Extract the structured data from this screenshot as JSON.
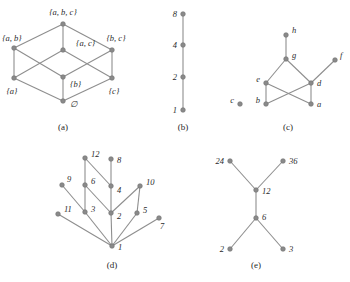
{
  "figure": {
    "width": 350,
    "height": 282,
    "background": "#ffffff",
    "node_color": "#8a8a8a",
    "edge_color": "#8e8e8e",
    "label_color": "#2b2b2b"
  },
  "panels": [
    {
      "id": "a",
      "caption": "(a)",
      "caption_pos": [
        63,
        130
      ],
      "description": "power-set-lattice",
      "nodes": [
        {
          "name": "abc",
          "label": "{a, b, c}",
          "x": 63,
          "y": 24,
          "label_x": 63,
          "label_y": 15,
          "anchor": "middle"
        },
        {
          "name": "ab",
          "label": "{a, b}",
          "x": 14,
          "y": 48,
          "label_x": 12,
          "label_y": 41,
          "anchor": "middle"
        },
        {
          "name": "ac",
          "label": "{a, c}",
          "x": 63,
          "y": 50,
          "label_x": 76,
          "label_y": 46,
          "anchor": "start"
        },
        {
          "name": "bc",
          "label": "{b, c}",
          "x": 112,
          "y": 50,
          "label_x": 116,
          "label_y": 41,
          "anchor": "middle"
        },
        {
          "name": "a",
          "label": "{a}",
          "x": 14,
          "y": 78,
          "label_x": 12,
          "label_y": 94,
          "anchor": "middle"
        },
        {
          "name": "b",
          "label": "{b}",
          "x": 63,
          "y": 77,
          "label_x": 70,
          "label_y": 87,
          "anchor": "start"
        },
        {
          "name": "c",
          "label": "{c}",
          "x": 112,
          "y": 78,
          "label_x": 114,
          "label_y": 94,
          "anchor": "middle"
        },
        {
          "name": "empty",
          "label": "∅",
          "x": 63,
          "y": 101,
          "label_x": 70,
          "label_y": 107,
          "anchor": "start"
        }
      ],
      "edges": [
        [
          "abc",
          "ab"
        ],
        [
          "abc",
          "ac"
        ],
        [
          "abc",
          "bc"
        ],
        [
          "ab",
          "a"
        ],
        [
          "ab",
          "b"
        ],
        [
          "ac",
          "a"
        ],
        [
          "ac",
          "c"
        ],
        [
          "bc",
          "b"
        ],
        [
          "bc",
          "c"
        ],
        [
          "a",
          "empty"
        ],
        [
          "b",
          "empty"
        ],
        [
          "c",
          "empty"
        ]
      ]
    },
    {
      "id": "b",
      "caption": "(b)",
      "caption_pos": [
        183,
        130
      ],
      "description": "divisibility-chain",
      "nodes": [
        {
          "name": "n8",
          "label": "8",
          "x": 183,
          "y": 14,
          "label_x": 177,
          "label_y": 17,
          "anchor": "end"
        },
        {
          "name": "n4",
          "label": "4",
          "x": 183,
          "y": 45,
          "label_x": 177,
          "label_y": 48,
          "anchor": "end"
        },
        {
          "name": "n2",
          "label": "2",
          "x": 183,
          "y": 77,
          "label_x": 177,
          "label_y": 80,
          "anchor": "end"
        },
        {
          "name": "n1",
          "label": "1",
          "x": 183,
          "y": 110,
          "label_x": 177,
          "label_y": 113,
          "anchor": "end"
        }
      ],
      "edges": [
        [
          "n8",
          "n4"
        ],
        [
          "n4",
          "n2"
        ],
        [
          "n2",
          "n1"
        ]
      ]
    },
    {
      "id": "c",
      "caption": "(c)",
      "caption_pos": [
        288,
        130
      ],
      "description": "poset-with-isolated-element",
      "nodes": [
        {
          "name": "h",
          "label": "h",
          "x": 286,
          "y": 35,
          "label_x": 292,
          "label_y": 33,
          "anchor": "start"
        },
        {
          "name": "g",
          "label": "g",
          "x": 286,
          "y": 59,
          "label_x": 292,
          "label_y": 58,
          "anchor": "start"
        },
        {
          "name": "f",
          "label": "f",
          "x": 335,
          "y": 60,
          "label_x": 340,
          "label_y": 58,
          "anchor": "start"
        },
        {
          "name": "e",
          "label": "e",
          "x": 266,
          "y": 83,
          "label_x": 260,
          "label_y": 82,
          "anchor": "end"
        },
        {
          "name": "d",
          "label": "d",
          "x": 311,
          "y": 83,
          "label_x": 317,
          "label_y": 86,
          "anchor": "start"
        },
        {
          "name": "c",
          "label": "c",
          "x": 240,
          "y": 104,
          "label_x": 234,
          "label_y": 103,
          "anchor": "end"
        },
        {
          "name": "b",
          "label": "b",
          "x": 266,
          "y": 104,
          "label_x": 260,
          "label_y": 103,
          "anchor": "end"
        },
        {
          "name": "a",
          "label": "a",
          "x": 311,
          "y": 104,
          "label_x": 317,
          "label_y": 107,
          "anchor": "start"
        }
      ],
      "edges": [
        [
          "h",
          "g"
        ],
        [
          "g",
          "e"
        ],
        [
          "g",
          "d"
        ],
        [
          "d",
          "f"
        ],
        [
          "e",
          "b"
        ],
        [
          "e",
          "a"
        ],
        [
          "d",
          "b"
        ],
        [
          "d",
          "a"
        ]
      ]
    },
    {
      "id": "d",
      "caption": "(d)",
      "caption_pos": [
        112,
        268
      ],
      "description": "divisibility-lattice-1-to-12",
      "nodes": [
        {
          "name": "n12",
          "label": "12",
          "x": 85,
          "y": 158,
          "label_x": 91,
          "label_y": 157,
          "anchor": "start"
        },
        {
          "name": "n8",
          "label": "8",
          "x": 111,
          "y": 159,
          "label_x": 117,
          "label_y": 163,
          "anchor": "start"
        },
        {
          "name": "n9",
          "label": "9",
          "x": 62,
          "y": 185,
          "label_x": 67,
          "label_y": 182,
          "anchor": "start"
        },
        {
          "name": "n6",
          "label": "6",
          "x": 85,
          "y": 185,
          "label_x": 91,
          "label_y": 184,
          "anchor": "start"
        },
        {
          "name": "n4",
          "label": "4",
          "x": 111,
          "y": 186,
          "label_x": 117,
          "label_y": 193,
          "anchor": "start"
        },
        {
          "name": "n10",
          "label": "10",
          "x": 140,
          "y": 186,
          "label_x": 146,
          "label_y": 185,
          "anchor": "start"
        },
        {
          "name": "n11",
          "label": "11",
          "x": 58,
          "y": 214,
          "label_x": 64,
          "label_y": 212,
          "anchor": "start"
        },
        {
          "name": "n3",
          "label": "3",
          "x": 85,
          "y": 212,
          "label_x": 91,
          "label_y": 212,
          "anchor": "start"
        },
        {
          "name": "n2",
          "label": "2",
          "x": 111,
          "y": 213,
          "label_x": 117,
          "label_y": 219,
          "anchor": "start"
        },
        {
          "name": "n5",
          "label": "5",
          "x": 137,
          "y": 213,
          "label_x": 143,
          "label_y": 213,
          "anchor": "start"
        },
        {
          "name": "n7",
          "label": "7",
          "x": 159,
          "y": 218,
          "label_x": 160,
          "label_y": 229,
          "anchor": "start"
        },
        {
          "name": "n1",
          "label": "1",
          "x": 112,
          "y": 246,
          "label_x": 118,
          "label_y": 250,
          "anchor": "start"
        }
      ],
      "edges": [
        [
          "n12",
          "n6"
        ],
        [
          "n12",
          "n4"
        ],
        [
          "n8",
          "n4"
        ],
        [
          "n9",
          "n3"
        ],
        [
          "n6",
          "n3"
        ],
        [
          "n6",
          "n2"
        ],
        [
          "n4",
          "n2"
        ],
        [
          "n10",
          "n5"
        ],
        [
          "n10",
          "n2"
        ],
        [
          "n11",
          "n1"
        ],
        [
          "n3",
          "n1"
        ],
        [
          "n2",
          "n1"
        ],
        [
          "n5",
          "n1"
        ],
        [
          "n7",
          "n1"
        ]
      ]
    },
    {
      "id": "e",
      "caption": "(e)",
      "caption_pos": [
        256,
        268
      ],
      "description": "divisor-poset",
      "nodes": [
        {
          "name": "n24",
          "label": "24",
          "x": 230,
          "y": 161,
          "label_x": 224,
          "label_y": 164,
          "anchor": "end"
        },
        {
          "name": "n36",
          "label": "36",
          "x": 283,
          "y": 161,
          "label_x": 289,
          "label_y": 164,
          "anchor": "start"
        },
        {
          "name": "n12",
          "label": "12",
          "x": 256,
          "y": 190,
          "label_x": 262,
          "label_y": 194,
          "anchor": "start"
        },
        {
          "name": "n6",
          "label": "6",
          "x": 256,
          "y": 218,
          "label_x": 262,
          "label_y": 220,
          "anchor": "start"
        },
        {
          "name": "n2",
          "label": "2",
          "x": 230,
          "y": 249,
          "label_x": 224,
          "label_y": 252,
          "anchor": "end"
        },
        {
          "name": "n3",
          "label": "3",
          "x": 283,
          "y": 249,
          "label_x": 289,
          "label_y": 252,
          "anchor": "start"
        }
      ],
      "edges": [
        [
          "n24",
          "n12"
        ],
        [
          "n36",
          "n12"
        ],
        [
          "n12",
          "n6"
        ],
        [
          "n6",
          "n2"
        ],
        [
          "n6",
          "n3"
        ]
      ]
    }
  ]
}
